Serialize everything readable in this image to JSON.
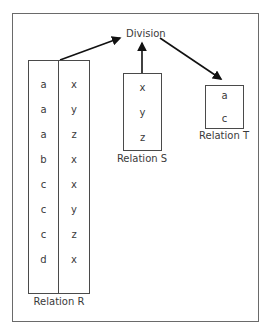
{
  "diagram": {
    "title": "Division",
    "relation_r": {
      "label": "Relation R",
      "col1": [
        "a",
        "a",
        "a",
        "b",
        "c",
        "c",
        "c",
        "d"
      ],
      "col2": [
        "x",
        "y",
        "z",
        "x",
        "x",
        "y",
        "z",
        "x"
      ]
    },
    "relation_s": {
      "label": "Relation S",
      "values": [
        "x",
        "y",
        "z"
      ]
    },
    "relation_t": {
      "label": "Relation T",
      "values": [
        "a",
        "c"
      ]
    },
    "edges": [
      {
        "from": "Relation R",
        "to": "Division"
      },
      {
        "from": "Relation S",
        "to": "Division"
      },
      {
        "from": "Division",
        "to": "Relation T"
      }
    ],
    "colors": {
      "border": "#4a4a4a",
      "frame": "#6a6a6a",
      "text": "#3a3a3a",
      "arrow": "#111111"
    }
  }
}
